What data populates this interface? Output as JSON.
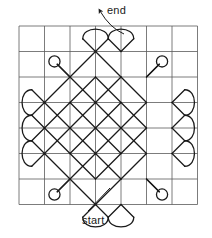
{
  "figure": {
    "name": "closed-path-weave-diagram",
    "background_color": "#ffffff",
    "line_color": "#1a1a1a"
  },
  "grid": {
    "columns": 7,
    "rows": 7,
    "x0": 19,
    "y0": 26,
    "cell": 25.5,
    "stroke_color": "#5a5a5a",
    "stroke_width": 0.8
  },
  "path": {
    "stroke_color": "#1a1a1a",
    "stroke_width": 1.3,
    "corner_radius": 9,
    "diamond_centers": [
      {
        "cx": 3,
        "cy": 1
      },
      {
        "cx": 2,
        "cy": 2
      },
      {
        "cx": 3,
        "cy": 2
      },
      {
        "cx": 4,
        "cy": 2
      },
      {
        "cx": 1,
        "cy": 3
      },
      {
        "cx": 2,
        "cy": 3
      },
      {
        "cx": 3,
        "cy": 3
      },
      {
        "cx": 4,
        "cy": 3
      },
      {
        "cx": 5,
        "cy": 3
      },
      {
        "cx": 1,
        "cy": 4
      },
      {
        "cx": 2,
        "cy": 4
      },
      {
        "cx": 3,
        "cy": 4
      },
      {
        "cx": 4,
        "cy": 4
      },
      {
        "cx": 5,
        "cy": 4
      },
      {
        "cx": 1,
        "cy": 5
      },
      {
        "cx": 2,
        "cy": 5
      },
      {
        "cx": 3,
        "cy": 5
      },
      {
        "cx": 4,
        "cy": 5
      },
      {
        "cx": 5,
        "cy": 5
      },
      {
        "cx": 2,
        "cy": 6
      },
      {
        "cx": 3,
        "cy": 6
      },
      {
        "cx": 4,
        "cy": 6
      },
      {
        "cx": 3,
        "cy": 7
      }
    ],
    "loops": [
      {
        "x": 3,
        "y": 1,
        "dir": "up"
      },
      {
        "x": 4,
        "y": 1,
        "dir": "up"
      },
      {
        "x": 2,
        "y": 2,
        "dir": "up-left"
      },
      {
        "x": 5,
        "y": 2,
        "dir": "up-right"
      },
      {
        "x": 1,
        "y": 3,
        "dir": "left"
      },
      {
        "x": 6,
        "y": 3,
        "dir": "right"
      },
      {
        "x": 1,
        "y": 4,
        "dir": "left"
      },
      {
        "x": 6,
        "y": 4,
        "dir": "right"
      },
      {
        "x": 1,
        "y": 5,
        "dir": "left"
      },
      {
        "x": 6,
        "y": 5,
        "dir": "right"
      },
      {
        "x": 2,
        "y": 6,
        "dir": "down-left"
      },
      {
        "x": 5,
        "y": 6,
        "dir": "down-right"
      },
      {
        "x": 3,
        "y": 7,
        "dir": "down"
      },
      {
        "x": 4,
        "y": 7,
        "dir": "down"
      }
    ]
  },
  "annotations": {
    "end": {
      "label": "end",
      "arrow_tip": {
        "x": 100,
        "y": 11
      },
      "arrow_tail": {
        "x": 124,
        "y": 34
      },
      "has_arrowhead": true
    },
    "start": {
      "label": "start",
      "leader_from": {
        "x": 88,
        "y": 211
      },
      "leader_to": {
        "x": 110,
        "y": 188
      },
      "has_arrowhead": false
    }
  }
}
